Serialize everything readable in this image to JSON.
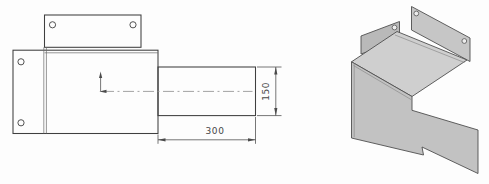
{
  "front_view": {
    "dim_horizontal": "300",
    "dim_vertical": "150"
  },
  "colors": {
    "outline": "#3f3f3f",
    "bend_line": "#6a6a6a",
    "dimension": "#4a4a4a",
    "centerline": "#919191",
    "background": "#fdfdfd",
    "iso_top_fill": "#cfcfcf",
    "iso_wall_fill": "#c2c2c2",
    "iso_back_plate_fill": "#c6c6c6",
    "iso_left_plate_fill": "#b9b9b9"
  }
}
